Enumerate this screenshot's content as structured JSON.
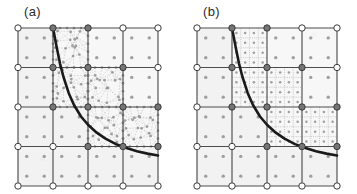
{
  "figure": {
    "background_color": "#ffffff",
    "panel_count": 2
  },
  "panels": [
    {
      "id": "panel-a",
      "label": "(a)",
      "refinement_style": "unstructured",
      "description_icon": "unstructured-mesh-icon"
    },
    {
      "id": "panel-b",
      "label": "(b)",
      "refinement_style": "structured",
      "description_icon": "structured-mesh-icon"
    }
  ],
  "style": {
    "cell_fill": "#f2f2f2",
    "cell_fill_light": "#f7f7f7",
    "cell_stroke": "#4d4d4d",
    "cell_stroke_light": "#8c8c8c",
    "node_open_fill": "#ffffff",
    "node_open_stroke": "#3a3a3a",
    "node_filled_fill": "#757575",
    "node_filled_stroke": "#3a3a3a",
    "interior_dot_fill": "#9a9a9a",
    "curve_color": "#1a1a1a",
    "curve_width": 2.6,
    "triangulation_color": "#b5b5b5",
    "subgrid_color": "#a8a8a8",
    "label_color": "#2b2b2b"
  },
  "chart_data": {
    "type": "diagram",
    "title": "",
    "xlabel": "",
    "ylabel": "",
    "xlim": [
      0,
      4
    ],
    "ylim": [
      0,
      4
    ],
    "grid": true,
    "legend": "none",
    "base_grid": {
      "columns": 4,
      "rows": 4,
      "cell_interior_dots_per_cell": 4,
      "interior_dot_layout": "2x2"
    },
    "curve": {
      "name": "interface",
      "form": "hyperbolic",
      "equation": "y = 0.72 / (x - 0.52) + 0.30",
      "x_start": 1.0,
      "x_end": 4.0,
      "points": [
        [
          1.0,
          4.0
        ],
        [
          1.1,
          3.54
        ],
        [
          1.2,
          3.1
        ],
        [
          1.3,
          2.76
        ],
        [
          1.45,
          2.35
        ],
        [
          1.6,
          2.05
        ],
        [
          1.8,
          1.76
        ],
        [
          2.0,
          1.55
        ],
        [
          2.25,
          1.35
        ],
        [
          2.5,
          1.2
        ],
        [
          2.8,
          1.06
        ],
        [
          3.1,
          0.96
        ],
        [
          3.4,
          0.88
        ],
        [
          3.7,
          0.82
        ],
        [
          4.0,
          0.77
        ]
      ]
    },
    "nodes_open": [
      [
        0,
        4
      ],
      [
        3,
        4
      ],
      [
        4,
        4
      ],
      [
        0,
        3
      ],
      [
        4,
        3
      ],
      [
        0,
        2
      ],
      [
        0,
        1
      ],
      [
        1,
        1
      ],
      [
        0,
        0
      ],
      [
        1,
        0
      ],
      [
        2,
        0
      ],
      [
        3,
        0
      ],
      [
        4,
        0
      ]
    ],
    "nodes_filled": [
      [
        1,
        4
      ],
      [
        2,
        4
      ],
      [
        1,
        3
      ],
      [
        2,
        3
      ],
      [
        3,
        3
      ],
      [
        1,
        2
      ],
      [
        2,
        2
      ],
      [
        3,
        2
      ],
      [
        4,
        2
      ],
      [
        2,
        1
      ],
      [
        3,
        1
      ],
      [
        4,
        1
      ]
    ],
    "refined_cells_panel_a": [
      {
        "col": 1,
        "row": 3,
        "mode": "unstructured"
      },
      {
        "col": 1,
        "row": 2,
        "mode": "unstructured"
      },
      {
        "col": 2,
        "row": 2,
        "mode": "unstructured"
      },
      {
        "col": 2,
        "row": 1,
        "mode": "unstructured"
      },
      {
        "col": 3,
        "row": 1,
        "mode": "unstructured"
      }
    ],
    "refined_cells_panel_b": [
      {
        "col": 1,
        "row": 3,
        "mode": "structured",
        "subdivisions": 2
      },
      {
        "col": 1,
        "row": 2,
        "mode": "structured",
        "subdivisions": 2
      },
      {
        "col": 2,
        "row": 2,
        "mode": "structured",
        "subdivisions": 2
      },
      {
        "col": 2,
        "row": 1,
        "mode": "structured",
        "subdivisions": 2
      },
      {
        "col": 3,
        "row": 1,
        "mode": "structured",
        "subdivisions": 2
      }
    ],
    "shaded_cells": [
      [
        0,
        0
      ],
      [
        1,
        0
      ],
      [
        2,
        0
      ],
      [
        3,
        0
      ],
      [
        0,
        1
      ],
      [
        1,
        1
      ],
      [
        0,
        2
      ],
      [
        0,
        3
      ]
    ]
  }
}
